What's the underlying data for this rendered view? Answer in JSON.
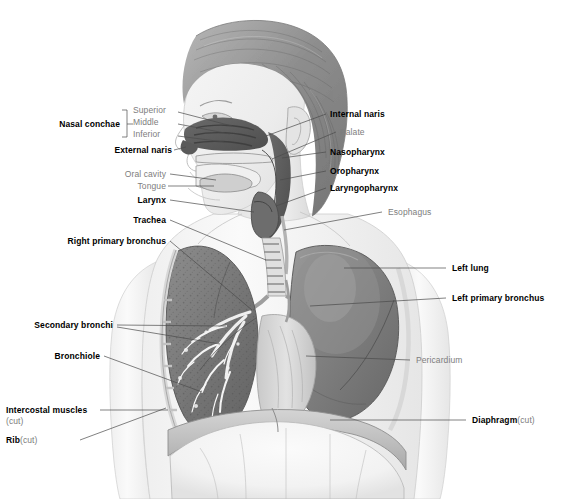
{
  "figure": {
    "background_color": "#ffffff",
    "label_bold_color": "#000000",
    "label_plain_color": "#7d7d7d",
    "leader_color": "#4a4a4a",
    "width": 564,
    "height": 499
  },
  "labels": {
    "nasal_conchae": "Nasal conchae",
    "superior": "Superior",
    "middle": "Middle",
    "inferior": "Inferior",
    "external_naris": "External naris",
    "oral_cavity": "Oral cavity",
    "tongue": "Tongue",
    "larynx": "Larynx",
    "trachea": "Trachea",
    "right_primary_bronchus": "Right primary bronchus",
    "secondary_bronchi": "Secondary bronchi",
    "bronchiole": "Bronchiole",
    "intercostal_muscles": "Intercostal muscles",
    "intercostal_muscles_cut": "(cut)",
    "rib": "Rib",
    "rib_cut": "(cut)",
    "internal_naris": "Internal naris",
    "palate": "Palate",
    "nasopharynx": "Nasopharynx",
    "oropharynx": "Oropharynx",
    "laryngopharynx": "Laryngopharynx",
    "esophagus": "Esophagus",
    "left_lung": "Left lung",
    "left_primary_bronchus": "Left primary bronchus",
    "pericardium": "Pericardium",
    "diaphragm": "Diaphragm",
    "diaphragm_cut": "(cut)"
  }
}
